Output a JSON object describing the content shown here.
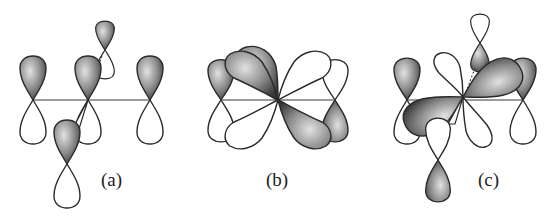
{
  "figure": {
    "panels": [
      {
        "id": "a",
        "label": "(a)"
      },
      {
        "id": "b",
        "label": "(b)"
      },
      {
        "id": "c",
        "label": "(c)"
      }
    ]
  },
  "colors": {
    "shade_dark": "#3c3c3c",
    "shade_light": "#d8d8d8",
    "outline": "#2a2a2a",
    "background": "#ffffff"
  }
}
